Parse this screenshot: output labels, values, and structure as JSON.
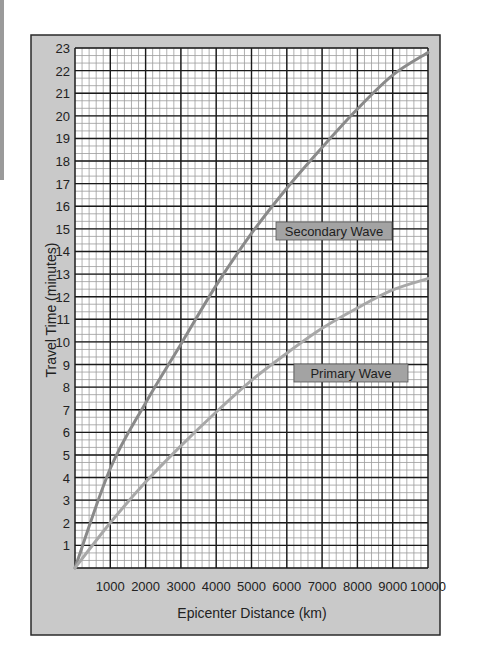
{
  "chart_data": {
    "type": "line",
    "title": "",
    "xlabel": "Epicenter Distance (km)",
    "ylabel": "Travel Time (minutes)",
    "xlim": [
      0,
      10000
    ],
    "ylim": [
      0,
      23
    ],
    "grid": true,
    "grid_major": {
      "x_step": 1000,
      "y_step": 1
    },
    "grid_minor": {
      "x_step": 200,
      "y_step": 0.333
    },
    "x_ticks": [
      "1000",
      "2000",
      "3000",
      "4000",
      "5000",
      "6000",
      "7000",
      "8000",
      "9000",
      "10000"
    ],
    "y_ticks": [
      "1",
      "2",
      "3",
      "4",
      "5",
      "6",
      "7",
      "8",
      "9",
      "10",
      "11",
      "12",
      "13",
      "14",
      "15",
      "16",
      "17",
      "18",
      "19",
      "20",
      "21",
      "22",
      "23"
    ],
    "x": [
      0,
      1000,
      2000,
      3000,
      4000,
      5000,
      6000,
      7000,
      8000,
      9000,
      10000
    ],
    "series": [
      {
        "name": "Secondary Wave",
        "values": [
          0,
          4.4,
          7.3,
          9.9,
          12.5,
          14.8,
          16.8,
          18.6,
          20.3,
          21.8,
          22.8
        ],
        "color": "#8a8a8a"
      },
      {
        "name": "Primary Wave",
        "values": [
          0,
          2.0,
          3.8,
          5.4,
          6.9,
          8.3,
          9.5,
          10.6,
          11.5,
          12.3,
          12.8
        ],
        "color": "#a8a8a8"
      }
    ],
    "legend": "inline labels",
    "annotations": [
      {
        "text": "Secondary Wave",
        "near_x": 6500,
        "near_y": 14.5
      },
      {
        "text": "Primary Wave",
        "near_x": 7200,
        "near_y": 8.1
      }
    ]
  },
  "labels": {
    "secondary": "Secondary Wave",
    "primary": "Primary Wave",
    "xlabel": "Epicenter Distance (km)",
    "ylabel": "Travel Time (minutes)"
  },
  "colors": {
    "frame_bg": "#c9c9c9",
    "frame_border": "#2a2a2a",
    "grid_major": "#1a1a1a",
    "grid_minor": "#9c9c9c",
    "label_bg": "#a3a3a3"
  }
}
